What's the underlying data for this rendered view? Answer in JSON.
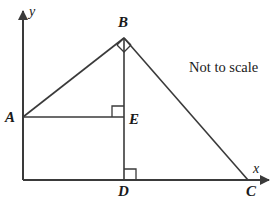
{
  "figure": {
    "note": "Not to scale",
    "axes": {
      "x_label": "x",
      "y_label": "y",
      "origin": [
        23,
        180
      ],
      "x_axis_end": [
        272,
        180
      ],
      "y_axis_end": [
        23,
        8
      ]
    },
    "points": {
      "A": {
        "label": "A",
        "x": 23,
        "y": 117
      },
      "B": {
        "label": "B",
        "x": 124,
        "y": 38
      },
      "C": {
        "label": "C",
        "x": 248,
        "y": 180
      },
      "D": {
        "label": "D",
        "x": 124,
        "y": 180
      },
      "E": {
        "label": "E",
        "x": 124,
        "y": 117
      }
    },
    "segments": [
      {
        "name": "AB",
        "from": "A",
        "to": "B"
      },
      {
        "name": "BC",
        "from": "B",
        "to": "C"
      },
      {
        "name": "BD",
        "from": "B",
        "to": "D"
      },
      {
        "name": "AE",
        "from": "A",
        "to": "E"
      }
    ],
    "right_angles": [
      {
        "name": "angle-at-B",
        "vertex": "B",
        "style": "diamond"
      },
      {
        "name": "angle-at-E",
        "vertex": "E",
        "style": "upper-left-square"
      },
      {
        "name": "angle-at-D",
        "vertex": "D",
        "style": "upper-right-square"
      }
    ],
    "colors": {
      "stroke": "#3a3a3a",
      "text": "#1a1a1a",
      "background": "#ffffff"
    }
  }
}
